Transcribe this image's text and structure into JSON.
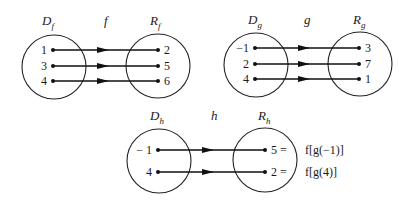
{
  "figure": {
    "colors": {
      "ink": "#111111",
      "background": "#ffffff"
    }
  },
  "mappings": [
    {
      "id": "f",
      "name": "f",
      "domain_label": {
        "main": "D",
        "sub": "f"
      },
      "range_label": {
        "main": "R",
        "sub": "f"
      },
      "domain_circle": {
        "cx": 54,
        "cy": 67,
        "r": 32
      },
      "range_circle": {
        "cx": 158,
        "cy": 66,
        "r": 32
      },
      "label_y": 25,
      "domain_label_x": 42,
      "function_label_x": 104,
      "range_label_x": 150,
      "start_x": 53,
      "end_x": 158,
      "arrow_x": 104,
      "pairs": [
        {
          "from": "1",
          "to": "2",
          "y": 50
        },
        {
          "from": "3",
          "to": "5",
          "y": 66
        },
        {
          "from": "4",
          "to": "6",
          "y": 81
        }
      ]
    },
    {
      "id": "g",
      "name": "g",
      "domain_label": {
        "main": "D",
        "sub": "g"
      },
      "range_label": {
        "main": "R",
        "sub": "g"
      },
      "domain_circle": {
        "cx": 256,
        "cy": 65,
        "r": 32
      },
      "range_circle": {
        "cx": 360,
        "cy": 64,
        "r": 32
      },
      "label_y": 24,
      "domain_label_x": 248,
      "function_label_x": 304,
      "range_label_x": 353,
      "start_x": 255,
      "end_x": 359,
      "arrow_x": 305,
      "pairs": [
        {
          "from": "−1",
          "to": "3",
          "y": 48
        },
        {
          "from": "2",
          "to": "7",
          "y": 64
        },
        {
          "from": "4",
          "to": "1",
          "y": 79
        }
      ]
    },
    {
      "id": "h",
      "name": "h",
      "domain_label": {
        "main": "D",
        "sub": "h"
      },
      "range_label": {
        "main": "R",
        "sub": "h"
      },
      "domain_circle": {
        "cx": 159,
        "cy": 161,
        "r": 32
      },
      "range_circle": {
        "cx": 265,
        "cy": 160,
        "r": 32
      },
      "label_y": 120,
      "domain_label_x": 150,
      "function_label_x": 211,
      "range_label_x": 258,
      "start_x": 158,
      "end_x": 265,
      "arrow_x": 209,
      "pairs": [
        {
          "from": "− 1",
          "to": "5 =",
          "y": 150,
          "annotation": "f[g(−1)]"
        },
        {
          "from": "4",
          "to": "2 =",
          "y": 172,
          "annotation": "f[g(4)]"
        }
      ]
    }
  ]
}
